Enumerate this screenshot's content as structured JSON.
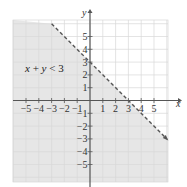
{
  "chart_data": {
    "type": "line",
    "title": "",
    "inequality_label": "x + y < 3",
    "boundary": {
      "equation": "x + y = 3",
      "style": "dashed",
      "points": [
        [
          -3,
          6
        ],
        [
          6,
          -3
        ]
      ],
      "x_intercept": 3,
      "y_intercept": 3
    },
    "shaded_region": "below the line (x + y < 3)",
    "xlabel": "x",
    "ylabel": "y",
    "xlim": [
      -6,
      6
    ],
    "ylim": [
      -6.3,
      6.3
    ],
    "x_ticks": [
      -5,
      -4,
      -3,
      -2,
      -1,
      1,
      2,
      3,
      4,
      5
    ],
    "y_ticks": [
      -5,
      -4,
      -3,
      -2,
      -1,
      1,
      2,
      3,
      4,
      5
    ],
    "x_tick_labels": [
      "−5",
      "−4",
      "−3",
      "−2",
      "−1",
      "1",
      "2",
      "3",
      "4",
      "5"
    ],
    "y_tick_labels": [
      "−5",
      "−4",
      "−3",
      "−2",
      "−1",
      "1",
      "2",
      "3",
      "4",
      "5"
    ],
    "grid": true,
    "colors": {
      "shade": "#e6e6e6",
      "grid": "#d8d8d8",
      "axis": "#555555",
      "boundary": "#555555"
    }
  },
  "labels": {
    "x_axis": "x",
    "y_axis": "y",
    "ineq_x": "x",
    "ineq_plus": " + ",
    "ineq_y": "y",
    "ineq_rest": " < 3"
  }
}
